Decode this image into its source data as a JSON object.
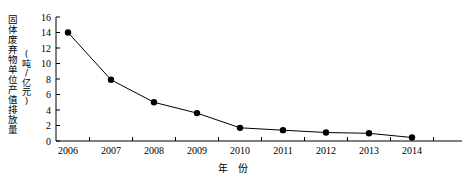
{
  "chart_data": {
    "type": "line",
    "title": "",
    "xlabel": "年  份",
    "ylabel": "固体废弃物单位产值排放量",
    "ylabel_unit": "(吨/亿元)",
    "categories": [
      "2006",
      "2007",
      "2008",
      "2009",
      "2010",
      "2011",
      "2012",
      "2013",
      "2014"
    ],
    "values": [
      14.0,
      7.9,
      5.0,
      3.6,
      1.7,
      1.4,
      1.1,
      1.0,
      0.45
    ],
    "series": [
      {
        "name": "固体废弃物单位产值排放量",
        "values": [
          14.0,
          7.9,
          5.0,
          3.6,
          1.7,
          1.4,
          1.1,
          1.0,
          0.45
        ]
      }
    ],
    "ylim": [
      0,
      16
    ],
    "yticks": [
      0,
      2,
      4,
      6,
      8,
      10,
      12,
      14,
      16
    ],
    "ytick_labels": [
      "0",
      "2",
      "4",
      "6",
      "8",
      "10",
      "12",
      "14",
      "16"
    ],
    "xtick_labels": [
      "2006",
      "2007",
      "2008",
      "2009",
      "2010",
      "2011",
      "2012",
      "2013",
      "2014"
    ],
    "grid": false,
    "legend": "none",
    "marker": "filled-circle",
    "line_color": "#000000",
    "marker_color": "#000000",
    "axis_color": "#000000",
    "background_color": "#ffffff"
  }
}
